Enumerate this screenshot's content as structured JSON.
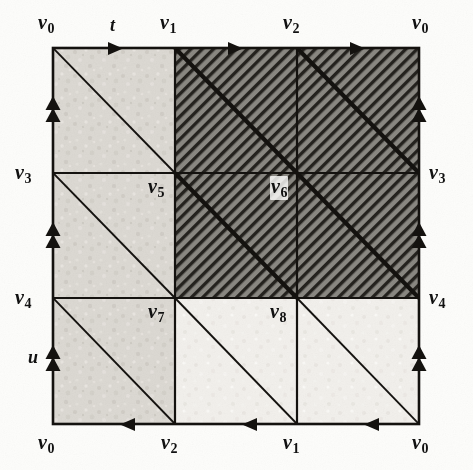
{
  "figure": {
    "kind": "topology-diagram",
    "square": {
      "left": 53,
      "top": 48,
      "right": 419,
      "bottom": 424
    },
    "grid": {
      "cols": 3,
      "rows": 3,
      "x_lines": [
        53,
        175,
        297,
        419
      ],
      "y_lines": [
        48,
        173,
        298,
        424
      ]
    },
    "colors": {
      "paper": "#fdfdfb",
      "ink": "#14120f",
      "light_fill": "#d8d5cf",
      "dark_fill": "#7d7b76",
      "hatch_dark": "#2a2824",
      "hatch_light": "#b9b6b0"
    },
    "shaded_block": {
      "col_start": 2,
      "col_end": 3,
      "row_start": 1,
      "row_end": 2,
      "style": "dark-hatched"
    }
  },
  "vertex_labels": {
    "top": [
      {
        "base": "v",
        "sub": "0"
      },
      {
        "base": "v",
        "sub": "1"
      },
      {
        "base": "v",
        "sub": "2"
      },
      {
        "base": "v",
        "sub": "0"
      }
    ],
    "bottom": [
      {
        "base": "v",
        "sub": "0"
      },
      {
        "base": "v",
        "sub": "2"
      },
      {
        "base": "v",
        "sub": "1"
      },
      {
        "base": "v",
        "sub": "0"
      }
    ],
    "left": [
      {
        "base": "v",
        "sub": "0"
      },
      {
        "base": "v",
        "sub": "3"
      },
      {
        "base": "v",
        "sub": "4"
      },
      {
        "base": "v",
        "sub": "0"
      }
    ],
    "right": [
      {
        "base": "v",
        "sub": "0"
      },
      {
        "base": "v",
        "sub": "3"
      },
      {
        "base": "v",
        "sub": "4"
      },
      {
        "base": "v",
        "sub": "0"
      }
    ],
    "interior": [
      {
        "base": "v",
        "sub": "5",
        "x": 150,
        "y": 188,
        "on_white": false
      },
      {
        "base": "v",
        "sub": "6",
        "x": 272,
        "y": 188,
        "on_white": true
      },
      {
        "base": "v",
        "sub": "7",
        "x": 150,
        "y": 313,
        "on_white": false
      },
      {
        "base": "v",
        "sub": "8",
        "x": 272,
        "y": 313,
        "on_white": false
      }
    ]
  },
  "edge_labels": {
    "top_generator": "t",
    "left_generator": "u"
  },
  "edge_markers": {
    "top": {
      "direction": "right",
      "arrow_count": 1,
      "glyph": "triangle-right"
    },
    "bottom": {
      "direction": "left",
      "arrow_count": 1,
      "glyph": "triangle-left"
    },
    "left": {
      "direction": "up",
      "arrow_count": 2,
      "glyph": "double-triangle-up"
    },
    "right": {
      "direction": "up",
      "arrow_count": 2,
      "glyph": "double-triangle-up"
    }
  }
}
